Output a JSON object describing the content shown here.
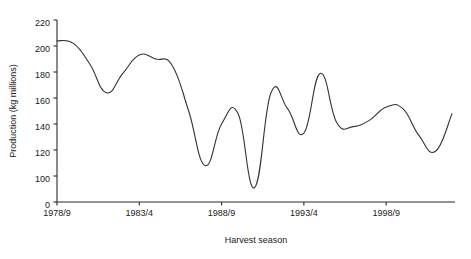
{
  "chart_data": {
    "type": "line",
    "title": "",
    "xlabel": "Harvest season",
    "ylabel": "Production (kg millions)",
    "xlim": [
      0,
      24
    ],
    "ylim": [
      0,
      220
    ],
    "yticks": [
      0,
      100,
      120,
      140,
      160,
      180,
      200,
      220
    ],
    "ytick_labels": [
      "0",
      "100",
      "120",
      "140",
      "160",
      "180",
      "200",
      "220"
    ],
    "y_axis_has_break": true,
    "grid": false,
    "legend": false,
    "legend_position": "none",
    "xticks": [
      0,
      5,
      10,
      15,
      20
    ],
    "xtick_labels": [
      "1978/9",
      "1983/4",
      "1988/9",
      "1993/4",
      "1998/9"
    ],
    "categories": [
      "1978/9",
      "1979/80",
      "1980/1",
      "1981/2",
      "1982/3",
      "1983/4",
      "1984/5",
      "1985/6",
      "1986/7",
      "1987/8",
      "1988/9",
      "1989/90",
      "1990/1",
      "1991/2",
      "1992/3",
      "1993/4",
      "1994/5",
      "1995/6",
      "1996/7",
      "1997/8",
      "1998/9",
      "1999/00",
      "2000/1",
      "2001/2",
      "2002/3"
    ],
    "values": [
      204,
      202,
      186,
      164,
      179,
      193,
      190,
      185,
      150,
      108,
      140,
      148,
      91,
      164,
      152,
      133,
      179,
      141,
      138,
      143,
      153,
      152,
      131,
      119,
      148
    ],
    "series": [
      {
        "name": "Production",
        "values": [
          204,
          202,
          186,
          164,
          179,
          193,
          190,
          185,
          150,
          108,
          140,
          148,
          91,
          164,
          152,
          133,
          179,
          141,
          138,
          143,
          153,
          152,
          131,
          119,
          148
        ]
      }
    ],
    "colors": {
      "line": "#333333",
      "axis": "#2b2b2b",
      "background": "#ffffff",
      "text": "#1a1a1a"
    }
  }
}
